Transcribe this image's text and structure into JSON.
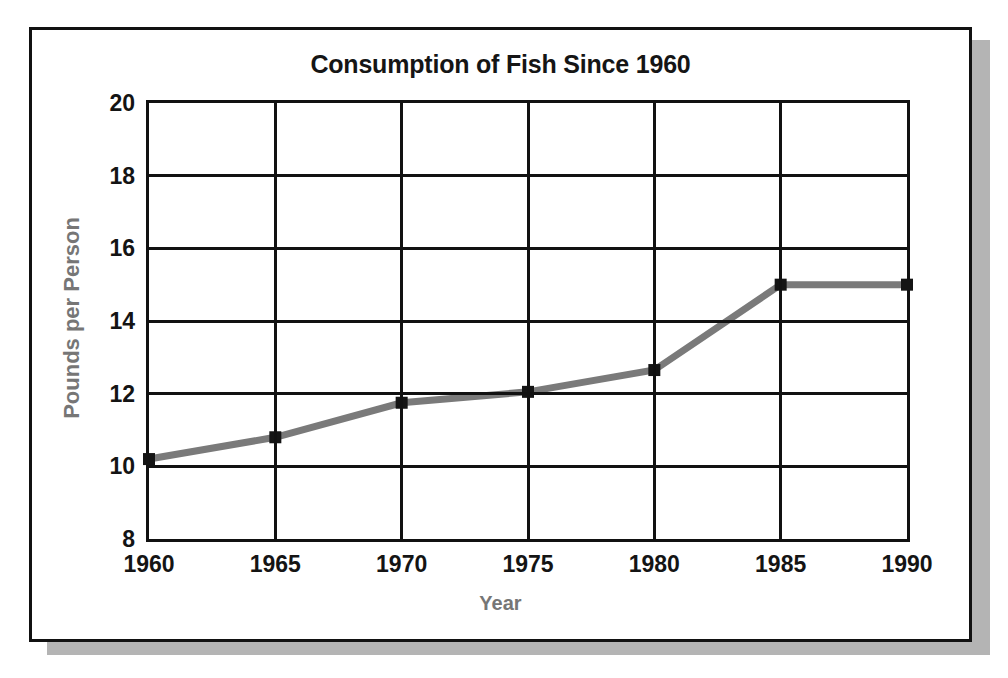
{
  "card": {
    "border_color": "#111111",
    "shadow_color": "#b4b4b4",
    "background": "#ffffff"
  },
  "chart_data": {
    "type": "line",
    "title": "Consumption of Fish Since 1960",
    "xlabel": "Year",
    "ylabel": "Pounds per Person",
    "x": [
      1960,
      1965,
      1970,
      1975,
      1980,
      1985,
      1990
    ],
    "xticklabels": [
      "1960",
      "1965",
      "1970",
      "1975",
      "1980",
      "1985",
      "1990"
    ],
    "values": [
      10.2,
      10.8,
      11.75,
      12.05,
      12.65,
      15.0,
      15.0
    ],
    "yticks": [
      8,
      10,
      12,
      14,
      16,
      18,
      20
    ],
    "yticklabels": [
      "8",
      "10",
      "12",
      "14",
      "16",
      "18",
      "20"
    ],
    "ylim": [
      8,
      20
    ],
    "xlim": [
      1960,
      1990
    ],
    "grid": true,
    "legend": false,
    "series_name": "Fish consumption",
    "line_color": "#7a7a7a",
    "line_width": 7,
    "marker": "square",
    "marker_color": "#141414",
    "marker_size": 12,
    "axis_color": "#111111",
    "tick_label_color": "#141414",
    "axis_label_color": "#767676",
    "title_color": "#151515"
  }
}
